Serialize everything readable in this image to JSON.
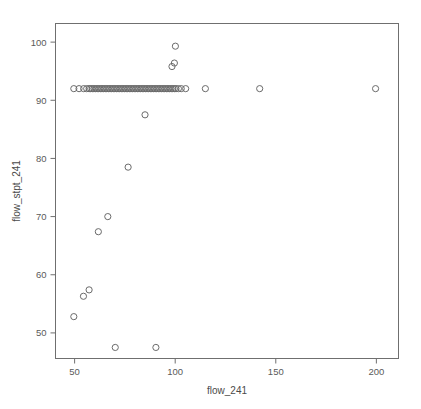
{
  "chart_data": {
    "type": "scatter",
    "title": "",
    "xlabel": "flow_241",
    "ylabel": "flow_stpt_241",
    "xlim": [
      40.5,
      211.0
    ],
    "ylim": [
      45.6,
      103.2
    ],
    "xticks": [
      50,
      100,
      150,
      200
    ],
    "yticks": [
      50,
      60,
      70,
      80,
      90,
      100
    ],
    "xtick_labels": [
      "50",
      "100",
      "150",
      "200"
    ],
    "ytick_labels": [
      "50",
      "60",
      "70",
      "80",
      "90",
      "100"
    ],
    "grid": false,
    "legend": null,
    "marker": "open-circle",
    "marker_color": "#6b6b6b",
    "marker_size": 3.1,
    "frame": true,
    "background": "#ffffff",
    "points": [
      [
        49.6,
        52.8
      ],
      [
        54.4,
        56.3
      ],
      [
        57.2,
        57.4
      ],
      [
        61.8,
        67.4
      ],
      [
        66.5,
        70.0
      ],
      [
        70.2,
        47.5
      ],
      [
        76.6,
        78.5
      ],
      [
        85.0,
        87.5
      ],
      [
        90.4,
        47.5
      ],
      [
        98.4,
        95.8
      ],
      [
        99.6,
        96.4
      ],
      [
        100.1,
        99.3
      ],
      [
        49.6,
        92.0
      ],
      [
        52.2,
        92.0
      ],
      [
        54.5,
        92.0
      ],
      [
        56.0,
        92.0
      ],
      [
        57.2,
        92.0
      ],
      [
        58.0,
        92.0
      ],
      [
        58.8,
        92.0
      ],
      [
        59.6,
        92.0
      ],
      [
        60.4,
        92.0
      ],
      [
        61.2,
        92.0
      ],
      [
        62.0,
        92.0
      ],
      [
        62.8,
        92.0
      ],
      [
        63.6,
        92.0
      ],
      [
        64.4,
        92.0
      ],
      [
        65.2,
        92.0
      ],
      [
        66.0,
        92.0
      ],
      [
        66.8,
        92.0
      ],
      [
        67.6,
        92.0
      ],
      [
        68.4,
        92.0
      ],
      [
        69.2,
        92.0
      ],
      [
        70.0,
        92.0
      ],
      [
        70.8,
        92.0
      ],
      [
        71.6,
        92.0
      ],
      [
        72.4,
        92.0
      ],
      [
        73.2,
        92.0
      ],
      [
        74.0,
        92.0
      ],
      [
        74.8,
        92.0
      ],
      [
        75.6,
        92.0
      ],
      [
        76.4,
        92.0
      ],
      [
        77.2,
        92.0
      ],
      [
        78.0,
        92.0
      ],
      [
        78.8,
        92.0
      ],
      [
        79.6,
        92.0
      ],
      [
        80.4,
        92.0
      ],
      [
        81.2,
        92.0
      ],
      [
        82.0,
        92.0
      ],
      [
        82.8,
        92.0
      ],
      [
        83.6,
        92.0
      ],
      [
        84.4,
        92.0
      ],
      [
        85.2,
        92.0
      ],
      [
        86.0,
        92.0
      ],
      [
        86.8,
        92.0
      ],
      [
        87.6,
        92.0
      ],
      [
        88.4,
        92.0
      ],
      [
        89.2,
        92.0
      ],
      [
        90.0,
        92.0
      ],
      [
        90.8,
        92.0
      ],
      [
        91.6,
        92.0
      ],
      [
        92.4,
        92.0
      ],
      [
        93.2,
        92.0
      ],
      [
        94.0,
        92.0
      ],
      [
        94.8,
        92.0
      ],
      [
        95.6,
        92.0
      ],
      [
        96.4,
        92.0
      ],
      [
        97.2,
        92.0
      ],
      [
        98.0,
        92.0
      ],
      [
        98.8,
        92.0
      ],
      [
        99.6,
        92.0
      ],
      [
        100.4,
        92.0
      ],
      [
        101.6,
        92.0
      ],
      [
        103.0,
        92.0
      ],
      [
        105.2,
        92.0
      ],
      [
        115.0,
        92.0
      ],
      [
        142.0,
        92.0
      ],
      [
        199.6,
        92.0
      ]
    ]
  }
}
